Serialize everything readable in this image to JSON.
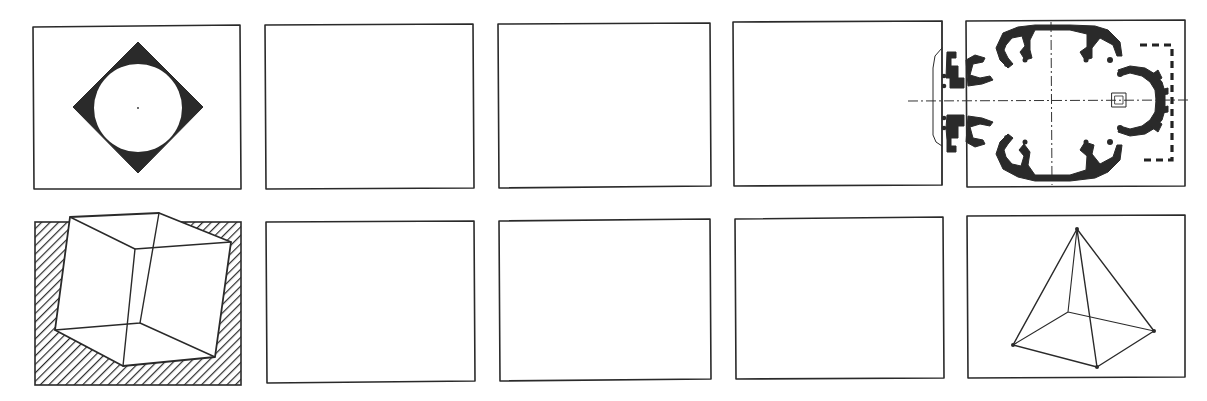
{
  "figure": {
    "rows": [
      {
        "panels": [
          {
            "id": "r1c1",
            "content": "diamond-with-inscribed-circle",
            "fill": "black corners, white circle, center dot"
          },
          {
            "id": "r1c2",
            "content": "empty"
          },
          {
            "id": "r1c3",
            "content": "empty"
          },
          {
            "id": "r1c4",
            "content": "empty"
          },
          {
            "id": "r1c5",
            "content": "centralized-church-floor-plan",
            "details": "octagonal plan with radiating piers, dash-dot axes, dashed apse outline, small square altar"
          }
        ]
      },
      {
        "panels": [
          {
            "id": "r2c1",
            "content": "tilted-wireframe-cube",
            "fill": "diagonal hatched background"
          },
          {
            "id": "r2c2",
            "content": "empty"
          },
          {
            "id": "r2c3",
            "content": "empty"
          },
          {
            "id": "r2c4",
            "content": "empty"
          },
          {
            "id": "r2c5",
            "content": "wireframe-square-pyramid"
          }
        ]
      }
    ]
  },
  "colors": {
    "ink": "#2a2a2a",
    "paper": "#ffffff"
  }
}
